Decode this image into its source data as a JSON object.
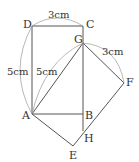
{
  "points": {
    "A": {
      "label": "A",
      "x": 32,
      "y": 114
    },
    "B": {
      "label": "B",
      "x": 83,
      "y": 114
    },
    "C": {
      "label": "C",
      "x": 83,
      "y": 26
    },
    "D": {
      "label": "D",
      "x": 32,
      "y": 26
    },
    "E": {
      "label": "E",
      "x": 73,
      "y": 146
    },
    "F": {
      "label": "F",
      "x": 124,
      "y": 83
    },
    "G": {
      "label": "G",
      "x": 83,
      "y": 43
    },
    "H": {
      "label": "H",
      "x": 83,
      "y": 131
    }
  },
  "dimensions": {
    "dc": "3cm",
    "da": "5cm",
    "ag": "5cm",
    "gf": "3cm"
  },
  "colors": {
    "line": "#555555",
    "arc": "#999999",
    "text": "#333333"
  }
}
